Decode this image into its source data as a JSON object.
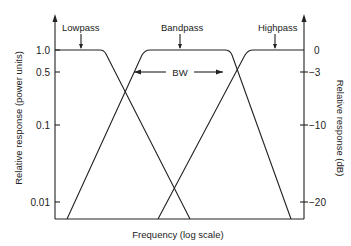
{
  "figure": {
    "type": "filter-response-diagram",
    "x_axis_label": "Frequency (log scale)",
    "left_axis_label": "Relative response (power units)",
    "right_axis_label": "Relative response (dB)",
    "left_ticks": [
      {
        "label": "1.0",
        "y": 50
      },
      {
        "label": "0.5",
        "y": 72
      },
      {
        "label": "0.1",
        "y": 125
      },
      {
        "label": "0.01",
        "y": 202
      }
    ],
    "right_ticks": [
      {
        "label": "0",
        "y": 50
      },
      {
        "label": "−3",
        "y": 72
      },
      {
        "label": "−10",
        "y": 125
      },
      {
        "label": "−20",
        "y": 202
      }
    ],
    "curves": [
      {
        "name": "Lowpass",
        "label": "Lowpass"
      },
      {
        "name": "Bandpass",
        "label": "Bandpass"
      },
      {
        "name": "Highpass",
        "label": "Highpass"
      }
    ],
    "bandwidth_label": "BW"
  }
}
